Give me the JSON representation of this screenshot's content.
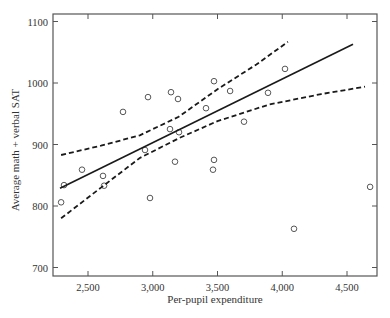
{
  "chart_data": {
    "type": "scatter",
    "title": "",
    "xlabel": "Per-pupil expenditure",
    "ylabel": "Average math + verbal SAT",
    "xlim": [
      2230,
      4730
    ],
    "ylim": [
      685,
      1115
    ],
    "x_ticks": [
      2500,
      3000,
      3500,
      4000,
      4500
    ],
    "x_tick_labels": [
      "2,500",
      "3,000",
      "3,500",
      "4,000",
      "4,500"
    ],
    "y_ticks": [
      700,
      800,
      900,
      1000,
      1100
    ],
    "y_tick_labels": [
      "700",
      "800",
      "900",
      "1000",
      "1100"
    ],
    "grid": false,
    "legend": null,
    "series": [
      {
        "name": "States",
        "type": "scatter",
        "marker": "open-circle",
        "points": [
          [
            2292,
            806
          ],
          [
            2315,
            834
          ],
          [
            2454,
            859
          ],
          [
            2616,
            849
          ],
          [
            2624,
            833
          ],
          [
            2770,
            953
          ],
          [
            2940,
            891
          ],
          [
            2963,
            977
          ],
          [
            2979,
            813
          ],
          [
            3133,
            925
          ],
          [
            3141,
            985
          ],
          [
            3172,
            872
          ],
          [
            3195,
            974
          ],
          [
            3203,
            920
          ],
          [
            3411,
            959
          ],
          [
            3473,
            1003
          ],
          [
            3465,
            859
          ],
          [
            3473,
            875
          ],
          [
            3597,
            987
          ],
          [
            3705,
            937
          ],
          [
            3890,
            984
          ],
          [
            4021,
            1023
          ],
          [
            4091,
            763
          ],
          [
            4678,
            831
          ]
        ]
      },
      {
        "name": "Regression line",
        "type": "line",
        "style": "solid",
        "points": [
          [
            2284,
            829
          ],
          [
            4546,
            1063
          ]
        ]
      },
      {
        "name": "Upper confidence band",
        "type": "line",
        "style": "dashed",
        "points": [
          [
            2292,
            883
          ],
          [
            2600,
            898
          ],
          [
            2900,
            915
          ],
          [
            3200,
            945
          ],
          [
            3500,
            990
          ],
          [
            3800,
            1030
          ],
          [
            4044,
            1067
          ]
        ]
      },
      {
        "name": "Lower confidence band",
        "type": "line",
        "style": "dashed",
        "points": [
          [
            2292,
            780
          ],
          [
            2600,
            830
          ],
          [
            2900,
            878
          ],
          [
            3200,
            910
          ],
          [
            3500,
            938
          ],
          [
            3900,
            965
          ],
          [
            4300,
            982
          ],
          [
            4639,
            994
          ]
        ]
      }
    ]
  }
}
